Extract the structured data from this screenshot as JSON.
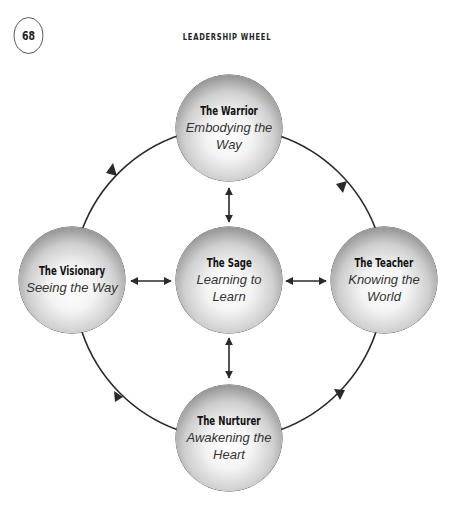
{
  "page": {
    "number": "68",
    "title": "LEADERSHIP WHEEL"
  },
  "diagram": {
    "nodes": {
      "warrior": {
        "title": "The Warrior",
        "subtitle": "Embodying the Way"
      },
      "visionary": {
        "title": "The Visionary",
        "subtitle": "Seeing the Way"
      },
      "sage": {
        "title": "The Sage",
        "subtitle": "Learning to Learn"
      },
      "teacher": {
        "title": "The Teacher",
        "subtitle": "Knowing the World"
      },
      "nurturer": {
        "title": "The Nurturer",
        "subtitle": "Awakening the Heart"
      }
    },
    "edges": [
      {
        "from": "visionary",
        "to": "warrior",
        "type": "arc-arrow"
      },
      {
        "from": "warrior",
        "to": "teacher",
        "type": "arc-arrow"
      },
      {
        "from": "teacher",
        "to": "nurturer",
        "type": "arc-arrow"
      },
      {
        "from": "nurturer",
        "to": "visionary",
        "type": "arc-arrow"
      },
      {
        "from": "sage",
        "to": "warrior",
        "type": "double-arrow"
      },
      {
        "from": "sage",
        "to": "teacher",
        "type": "double-arrow"
      },
      {
        "from": "sage",
        "to": "nurturer",
        "type": "double-arrow"
      },
      {
        "from": "sage",
        "to": "visionary",
        "type": "double-arrow"
      }
    ],
    "colors": {
      "line": "#2a2a2a",
      "sphere_edge": "#333333",
      "sphere_center": "#ffffff"
    }
  }
}
